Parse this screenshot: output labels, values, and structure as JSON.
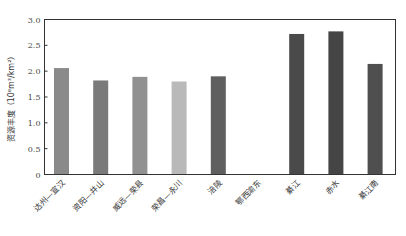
{
  "chart_data": {
    "type": "bar",
    "title": "",
    "xlabel": "",
    "ylabel": "资源丰度（10⁸m³/km²）",
    "ylim": [
      0,
      3.0
    ],
    "yticks": [
      "0",
      "0.5",
      "1.0",
      "1.5",
      "2.0",
      "2.5",
      "3.0"
    ],
    "grid": false,
    "legend": null,
    "categories": [
      "达州—宣汉",
      "资阳—井山",
      "威远—荣县",
      "荣昌—永川",
      "涪陵",
      "鄂西渝东",
      "綦江",
      "赤水",
      "綦江南"
    ],
    "values": [
      2.06,
      1.82,
      1.89,
      1.8,
      1.9,
      0,
      2.72,
      2.77,
      2.14
    ],
    "bar_colors": [
      "#8a8a8a",
      "#7a7a7a",
      "#919191",
      "#b9b9b9",
      "#5f5f5f",
      "#ffffff",
      "#4a4a4a",
      "#454545",
      "#4f4f4f"
    ]
  }
}
